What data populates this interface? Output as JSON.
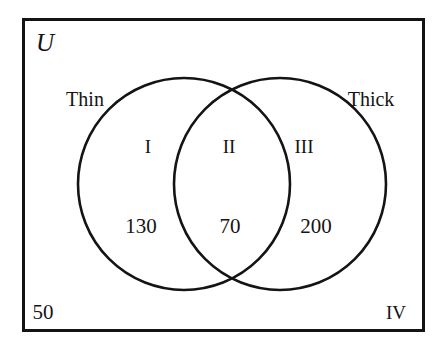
{
  "figure": {
    "type": "venn-diagram",
    "sets_count": 2,
    "universe_label": "U",
    "background_color": "#ffffff",
    "stroke_color": "#141414",
    "text_color": "#141414",
    "frame": {
      "x": 22,
      "y": 18,
      "width": 403,
      "height": 314,
      "border_width": 3
    },
    "circles": [
      {
        "name": "Thin",
        "cx": 184,
        "cy": 184,
        "r": 106,
        "stroke_width": 2.6
      },
      {
        "name": "Thick",
        "cx": 280,
        "cy": 184,
        "r": 106,
        "stroke_width": 2.6
      }
    ]
  },
  "labels": {
    "universe": {
      "text": "U",
      "x": 45,
      "y": 42
    },
    "set_left": {
      "text": "Thin",
      "x": 85,
      "y": 99
    },
    "set_right": {
      "text": "Thick",
      "x": 371,
      "y": 99
    }
  },
  "regions": [
    {
      "roman": "I",
      "count": "130",
      "roman_x": 148,
      "roman_y": 146,
      "count_x": 141,
      "count_y": 226
    },
    {
      "roman": "II",
      "count": "70",
      "roman_x": 229,
      "roman_y": 146,
      "count_x": 230,
      "count_y": 226
    },
    {
      "roman": "III",
      "count": "200",
      "roman_x": 304,
      "roman_y": 146,
      "count_x": 316,
      "count_y": 226
    }
  ],
  "outside": {
    "count": "50",
    "count_x": 43,
    "count_y": 312,
    "roman": "IV",
    "roman_x": 396,
    "roman_y": 312
  }
}
